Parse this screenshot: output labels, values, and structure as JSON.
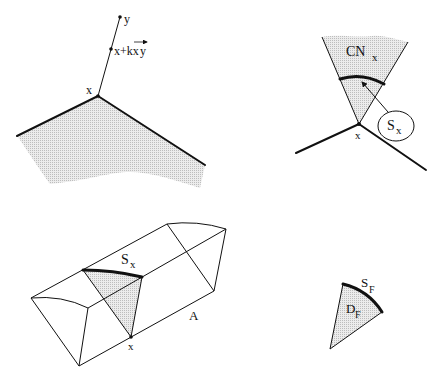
{
  "figure_panels": [
    {
      "id": "panel-top-left",
      "labels": {
        "point_y": "y",
        "point_mid": "x+kx",
        "vector_xy": "y",
        "vector_prefix": "x",
        "apex": "x"
      }
    },
    {
      "id": "panel-top-right",
      "labels": {
        "cone": "CN",
        "cone_sub": "x",
        "section": "S",
        "section_sub": "x",
        "apex": "x"
      }
    },
    {
      "id": "panel-bottom-left",
      "labels": {
        "section": "S",
        "section_sub": "x",
        "edge": "A",
        "point": "x"
      }
    },
    {
      "id": "panel-bottom-right",
      "labels": {
        "arc": "S",
        "arc_sub": "F",
        "region": "D",
        "region_sub": "F"
      }
    }
  ],
  "colors": {
    "ink": "#111111",
    "shade": "#d9d9d9"
  }
}
